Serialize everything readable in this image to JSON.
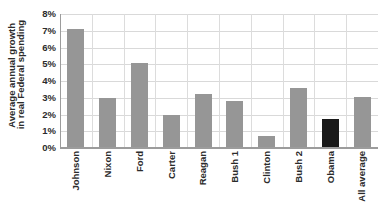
{
  "chart_data": {
    "type": "bar",
    "title": "",
    "subtitle": "",
    "xlabel": "",
    "ylabel": "Average annual growth in real Federal spending",
    "ylabel_lines": [
      "Average annual growth",
      "in real Federal spending"
    ],
    "categories": [
      "Johnson",
      "Nixon",
      "Ford",
      "Carter",
      "Reagan",
      "Bush 1",
      "Clinton",
      "Bush 2",
      "Obama",
      "All average"
    ],
    "values": [
      7.1,
      3.0,
      5.1,
      2.0,
      3.25,
      2.8,
      0.7,
      3.6,
      1.75,
      3.05
    ],
    "value_labels": [
      "7.1%",
      "3.0%",
      "5.1%",
      "2.0%",
      "3.25%",
      "2.8%",
      "0.7%",
      "3.6%",
      "1.75%",
      "3.05%"
    ],
    "bar_colors": [
      "#969696",
      "#969696",
      "#969696",
      "#969696",
      "#969696",
      "#969696",
      "#969696",
      "#969696",
      "#1a1a1a",
      "#969696"
    ],
    "highlight_category": "Obama",
    "ylim": [
      0,
      8
    ],
    "ytick_values": [
      0,
      1,
      2,
      3,
      4,
      5,
      6,
      7,
      8
    ],
    "ytick_labels": [
      "0%",
      "1%",
      "2%",
      "3%",
      "4%",
      "5%",
      "6%",
      "7%",
      "8%"
    ],
    "grid": "horizontal-and-vertical",
    "legend": "none",
    "legend_position": "",
    "annotations": []
  },
  "colors": {
    "bar_default": "#969696",
    "bar_highlight": "#1a1a1a",
    "gridline": "#d9d9d9",
    "vertical_gridline": "#dcdcdc",
    "axis_line": "#9c9c9c",
    "text": "#2b2b2b",
    "background": "#ffffff"
  }
}
